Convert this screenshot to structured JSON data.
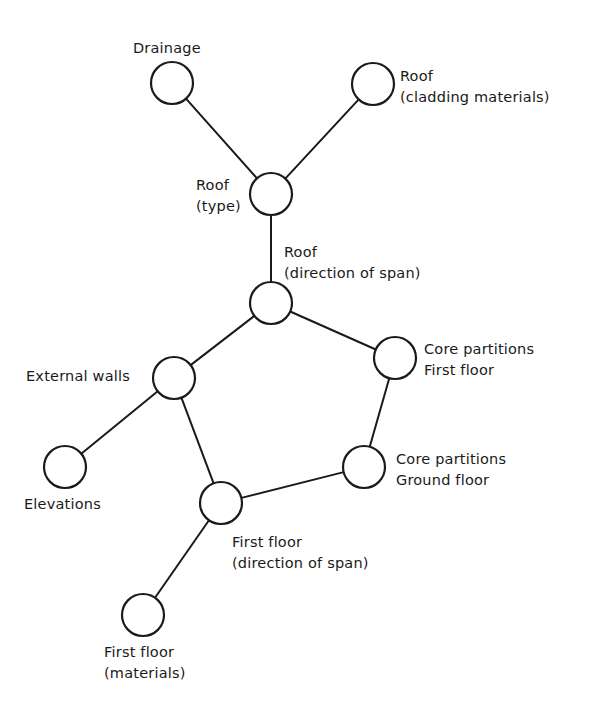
{
  "diagram": {
    "type": "network",
    "colors": {
      "line": "#1a1a1a",
      "background": "#ffffff"
    },
    "node_radius": 21,
    "nodes": [
      {
        "id": "drainage",
        "cx": 172,
        "cy": 83,
        "label_lines": [
          "Drainage"
        ]
      },
      {
        "id": "roof-cladding",
        "cx": 373,
        "cy": 84,
        "label_lines": [
          "Roof",
          "(cladding materials)"
        ]
      },
      {
        "id": "roof-type",
        "cx": 271,
        "cy": 194,
        "label_lines": [
          "Roof",
          "(type)"
        ]
      },
      {
        "id": "roof-span",
        "cx": 271,
        "cy": 303,
        "label_lines": [
          "Roof",
          "(direction of span)"
        ]
      },
      {
        "id": "external-walls",
        "cx": 174,
        "cy": 378,
        "label_lines": [
          "External walls"
        ]
      },
      {
        "id": "core-first",
        "cx": 395,
        "cy": 358,
        "label_lines": [
          "Core partitions",
          "First floor"
        ]
      },
      {
        "id": "core-ground",
        "cx": 364,
        "cy": 467,
        "label_lines": [
          "Core partitions",
          "Ground floor"
        ]
      },
      {
        "id": "elevations",
        "cx": 65,
        "cy": 467,
        "label_lines": [
          "Elevations"
        ]
      },
      {
        "id": "first-span",
        "cx": 221,
        "cy": 503,
        "label_lines": [
          "First floor",
          "(direction of span)"
        ]
      },
      {
        "id": "first-materials",
        "cx": 143,
        "cy": 615,
        "label_lines": [
          "First floor",
          "(materials)"
        ]
      }
    ],
    "edges": [
      [
        "drainage",
        "roof-type"
      ],
      [
        "roof-cladding",
        "roof-type"
      ],
      [
        "roof-type",
        "roof-span"
      ],
      [
        "roof-span",
        "external-walls"
      ],
      [
        "roof-span",
        "core-first"
      ],
      [
        "core-first",
        "core-ground"
      ],
      [
        "core-ground",
        "first-span"
      ],
      [
        "external-walls",
        "first-span"
      ],
      [
        "external-walls",
        "elevations"
      ],
      [
        "first-span",
        "first-materials"
      ]
    ],
    "labels": {
      "drainage": {
        "line1": "Drainage"
      },
      "roof_cladding": {
        "line1": "Roof",
        "line2": "(cladding materials)"
      },
      "roof_type": {
        "line1": "Roof",
        "line2": "(type)"
      },
      "roof_span": {
        "line1": "Roof",
        "line2": "(direction of span)"
      },
      "external_walls": {
        "line1": "External walls"
      },
      "core_first": {
        "line1": "Core partitions",
        "line2": "First floor"
      },
      "core_ground": {
        "line1": "Core partitions",
        "line2": "Ground floor"
      },
      "elevations": {
        "line1": "Elevations"
      },
      "first_span": {
        "line1": "First floor",
        "line2": "(direction of span)"
      },
      "first_materials": {
        "line1": "First floor",
        "line2": "(materials)"
      }
    }
  }
}
